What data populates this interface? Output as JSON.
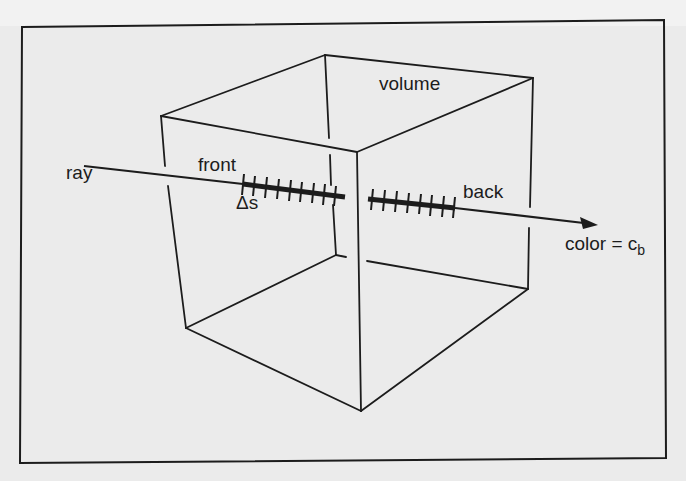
{
  "diagram": {
    "colors": {
      "background": "#ebebeb",
      "page_top": "#f2f2f2",
      "ink": "#1c1c1c"
    },
    "labels": {
      "ray": "ray",
      "front": "front",
      "delta_s": "Δs",
      "volume": "volume",
      "back": "back",
      "color_eq": "color = c",
      "color_sub": "b"
    },
    "cube": {
      "vertices": {
        "top_back": [
          325,
          55
        ],
        "top_left": [
          161,
          116
        ],
        "top_front": [
          357,
          152
        ],
        "top_right": [
          533,
          78
        ],
        "bottom_back": [
          336,
          255
        ],
        "bottom_left": [
          186,
          328
        ],
        "bottom_front": [
          361,
          411
        ],
        "bottom_right": [
          528,
          289
        ]
      }
    },
    "ray": {
      "start": [
        84,
        166
      ],
      "end": [
        598,
        225
      ],
      "front_sample_segment": {
        "from": [
          243,
          184
        ],
        "to": [
          345,
          197
        ],
        "tick_count": 9
      },
      "back_sample_segment": {
        "from": [
          368,
          199
        ],
        "to": [
          455,
          208
        ],
        "tick_count": 8
      }
    }
  }
}
